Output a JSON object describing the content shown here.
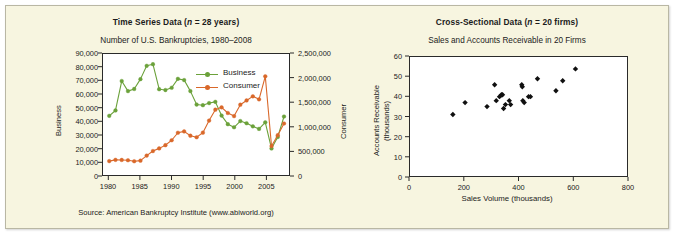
{
  "figure": {
    "background_color": "#f7f5e0",
    "border_color": "#b9b7a4"
  },
  "left_panel": {
    "title_prefix": "Time Series Data (",
    "title_italic": "n",
    "title_suffix": " = 28 years)",
    "title_full": "Time Series Data (n = 28 years)",
    "subtitle": "Number of U.S. Bankruptcies, 1980–2008",
    "source": "Source: American Bankruptcy Institute (www.abiworld.org)",
    "y_left_label": "Business",
    "y_right_label": "Consumer",
    "y_left_ticks": [
      "0",
      "10,000",
      "20,000",
      "30,000",
      "40,000",
      "50,000",
      "60,000",
      "70,000",
      "80,000",
      "90,000"
    ],
    "y_right_ticks": [
      "0",
      "500,000",
      "1,000,000",
      "1,500,000",
      "2,000,000",
      "2,500,000"
    ],
    "x_ticks": [
      "1980",
      "1985",
      "1990",
      "1995",
      "2000",
      "2005"
    ],
    "legend": [
      {
        "label": "Business",
        "color": "#6ba13a"
      },
      {
        "label": "Consumer",
        "color": "#d9682a"
      }
    ]
  },
  "right_panel": {
    "title_prefix": "Cross-Sectional Data (",
    "title_italic": "n",
    "title_suffix": " = 20 firms)",
    "title_full": "Cross-Sectional Data (n = 20 firms)",
    "subtitle": "Sales and Accounts Receivable in 20 Firms",
    "y_label_line1": "Accounts Receivable",
    "y_label_line2": "(thousands)",
    "x_label": "Sales Volume (thousands)",
    "y_ticks": [
      "0",
      "10",
      "20",
      "30",
      "40",
      "50",
      "60"
    ],
    "x_ticks": [
      "0",
      "200",
      "400",
      "600",
      "800"
    ],
    "marker_color": "#101010"
  },
  "chart_data": [
    {
      "type": "line",
      "id": "time-series-bankruptcies",
      "title": "Number of U.S. Bankruptcies, 1980–2008",
      "xlabel": "",
      "ylabel": "Business",
      "y2label": "Consumer",
      "xlim": [
        1979.0,
        2008.8
      ],
      "ylim": [
        0,
        90000
      ],
      "y2lim": [
        0,
        2500000
      ],
      "grid": false,
      "legend_position": "upper-right-inside",
      "x": [
        1980,
        1981,
        1982,
        1983,
        1984,
        1985,
        1986,
        1987,
        1988,
        1989,
        1990,
        1991,
        1992,
        1993,
        1994,
        1995,
        1996,
        1997,
        1998,
        1999,
        2000,
        2001,
        2002,
        2003,
        2004,
        2005,
        2006,
        2007,
        2008
      ],
      "series": [
        {
          "name": "Business",
          "color": "#6ba13a",
          "axis": "left",
          "values": [
            44000,
            48000,
            69900,
            62400,
            64000,
            71300,
            81200,
            82400,
            63800,
            63200,
            64900,
            71500,
            70600,
            62400,
            52400,
            51900,
            53500,
            54400,
            44200,
            37800,
            35500,
            40100,
            38500,
            36200,
            34300,
            39200,
            19700,
            28300,
            43500
          ]
        },
        {
          "name": "Consumer",
          "color": "#d9682a",
          "axis": "right",
          "values": [
            287000,
            313000,
            311000,
            305000,
            284000,
            297000,
            401000,
            495000,
            550000,
            616000,
            718000,
            873000,
            901000,
            812000,
            780000,
            875000,
            1125000,
            1350000,
            1398000,
            1281000,
            1217000,
            1452000,
            1540000,
            1625000,
            1563000,
            2039000,
            598000,
            822000,
            1064000
          ]
        }
      ]
    },
    {
      "type": "scatter",
      "id": "cross-sectional-sales-ar",
      "title": "Sales and Accounts Receivable in 20 Firms",
      "xlabel": "Sales Volume (thousands)",
      "ylabel": "Accounts Receivable (thousands)",
      "xlim": [
        0,
        800
      ],
      "ylim": [
        0,
        60
      ],
      "grid": false,
      "marker": "diamond",
      "marker_color": "#101010",
      "points": [
        {
          "x": 158,
          "y": 31
        },
        {
          "x": 203,
          "y": 37
        },
        {
          "x": 284,
          "y": 35
        },
        {
          "x": 312,
          "y": 46
        },
        {
          "x": 318,
          "y": 38
        },
        {
          "x": 330,
          "y": 40
        },
        {
          "x": 337,
          "y": 41
        },
        {
          "x": 341,
          "y": 41
        },
        {
          "x": 345,
          "y": 34
        },
        {
          "x": 352,
          "y": 36
        },
        {
          "x": 366,
          "y": 38
        },
        {
          "x": 371,
          "y": 36
        },
        {
          "x": 412,
          "y": 46
        },
        {
          "x": 414,
          "y": 45
        },
        {
          "x": 416,
          "y": 38
        },
        {
          "x": 421,
          "y": 37
        },
        {
          "x": 437,
          "y": 40
        },
        {
          "x": 444,
          "y": 40
        },
        {
          "x": 470,
          "y": 49
        },
        {
          "x": 538,
          "y": 43
        },
        {
          "x": 563,
          "y": 48
        },
        {
          "x": 610,
          "y": 54
        }
      ]
    }
  ]
}
